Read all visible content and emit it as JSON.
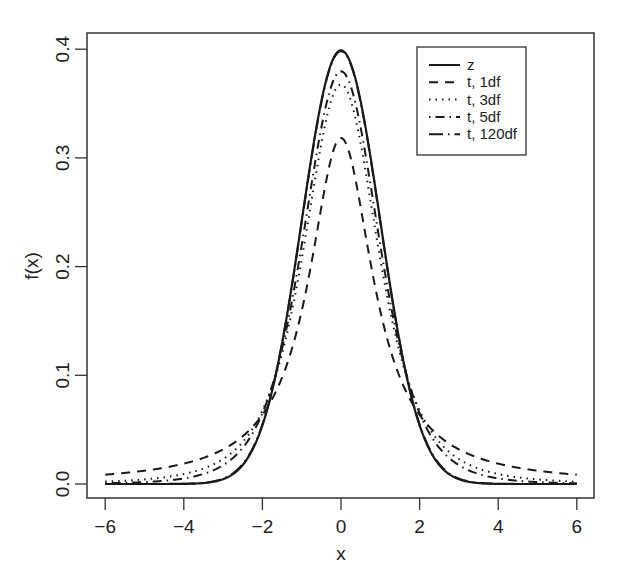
{
  "chart_data": {
    "type": "line",
    "title": "",
    "xlabel": "x",
    "ylabel": "f(x)",
    "xlim": [
      -6,
      6
    ],
    "ylim": [
      0,
      0.4
    ],
    "grid": false,
    "legend_position": "top-right (inside plot)",
    "x_ticks": [
      -6,
      -4,
      -2,
      0,
      2,
      4,
      6
    ],
    "x_tick_labels": [
      "−6",
      "−4",
      "−2",
      "0",
      "2",
      "4",
      "6"
    ],
    "y_ticks": [
      0.0,
      0.1,
      0.2,
      0.3,
      0.4
    ],
    "y_tick_labels": [
      "0.0",
      "0.1",
      "0.2",
      "0.3",
      "0.4"
    ],
    "x": [
      -6,
      -5,
      -4,
      -3,
      -2,
      -1.5,
      -1,
      -0.5,
      0,
      0.5,
      1,
      1.5,
      2,
      3,
      4,
      5,
      6
    ],
    "series": [
      {
        "name": "z",
        "line_style": "solid",
        "distribution": "normal",
        "df": null,
        "values": [
          0.0,
          0.0,
          0.0001,
          0.0044,
          0.054,
          0.1295,
          0.242,
          0.3521,
          0.3989,
          0.3521,
          0.242,
          0.1295,
          0.054,
          0.0044,
          0.0001,
          0.0,
          0.0
        ]
      },
      {
        "name": "t, 1df",
        "line_style": "dashed",
        "distribution": "t",
        "df": 1,
        "values": [
          0.0086,
          0.0122,
          0.0187,
          0.0318,
          0.0637,
          0.0979,
          0.1592,
          0.2546,
          0.3183,
          0.2546,
          0.1592,
          0.0979,
          0.0637,
          0.0318,
          0.0187,
          0.0122,
          0.0086
        ]
      },
      {
        "name": "t, 3df",
        "line_style": "dotted",
        "distribution": "t",
        "df": 3,
        "values": [
          0.0021,
          0.0042,
          0.0092,
          0.023,
          0.0675,
          0.1274,
          0.2067,
          0.3279,
          0.3676,
          0.3279,
          0.2067,
          0.1274,
          0.0675,
          0.023,
          0.0092,
          0.0042,
          0.0021
        ]
      },
      {
        "name": "t, 5df",
        "line_style": "dot-dash",
        "distribution": "t",
        "df": 5,
        "values": [
          0.0009,
          0.0018,
          0.0051,
          0.0173,
          0.0651,
          0.1245,
          0.2197,
          0.3403,
          0.3796,
          0.3403,
          0.2197,
          0.1245,
          0.0651,
          0.0173,
          0.0051,
          0.0018,
          0.0009
        ]
      },
      {
        "name": "t, 120df",
        "line_style": "long-dash-dot",
        "distribution": "t",
        "df": 120,
        "values": [
          0.0,
          0.0,
          0.0001,
          0.0049,
          0.0554,
          0.1301,
          0.2411,
          0.351,
          0.3981,
          0.351,
          0.2411,
          0.1301,
          0.0554,
          0.0049,
          0.0001,
          0.0,
          0.0
        ]
      }
    ]
  },
  "legend": {
    "items": [
      {
        "label": "z",
        "style": "solid"
      },
      {
        "label": "t, 1df",
        "style": "dashed"
      },
      {
        "label": "t, 3df",
        "style": "dotted"
      },
      {
        "label": "t, 5df",
        "style": "dot-dash"
      },
      {
        "label": "t, 120df",
        "style": "long-dash-dot"
      }
    ]
  },
  "colors": {
    "line": "#1a1a1a",
    "axis": "#333333",
    "background": "#ffffff"
  }
}
